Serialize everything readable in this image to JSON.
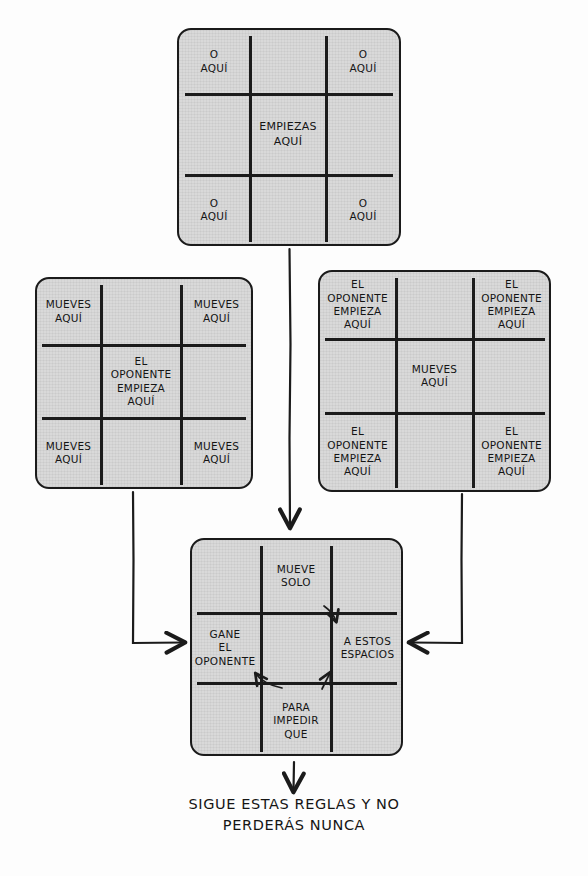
{
  "diagram": {
    "caption_lines": [
      "SIGUE ESTAS REGLAS Y NO",
      "PERDERÁS NUNCA"
    ],
    "colors": {
      "ink": "#1b1b1b",
      "board_fill": "#d9d9d9",
      "page": "#fdfdfd"
    },
    "grids": [
      {
        "id": "grid-empiezas",
        "name": "board-start",
        "cells": [
          {
            "pos": "top-left",
            "lines": [
              "O",
              "AQUÍ"
            ]
          },
          {
            "pos": "top-center",
            "lines": []
          },
          {
            "pos": "top-right",
            "lines": [
              "O",
              "AQUÍ"
            ]
          },
          {
            "pos": "middle-left",
            "lines": []
          },
          {
            "pos": "middle-center",
            "lines": [
              "EMPIEZAS",
              "AQUÍ"
            ]
          },
          {
            "pos": "middle-right",
            "lines": []
          },
          {
            "pos": "bottom-left",
            "lines": [
              "O",
              "AQUÍ"
            ]
          },
          {
            "pos": "bottom-center",
            "lines": []
          },
          {
            "pos": "bottom-right",
            "lines": [
              "O",
              "AQUÍ"
            ]
          }
        ]
      },
      {
        "id": "grid-oponente-centro",
        "name": "board-opponent-center",
        "cells": [
          {
            "pos": "top-left",
            "lines": [
              "MUEVES",
              "AQUÍ"
            ]
          },
          {
            "pos": "top-center",
            "lines": []
          },
          {
            "pos": "top-right",
            "lines": [
              "MUEVES",
              "AQUÍ"
            ]
          },
          {
            "pos": "middle-left",
            "lines": []
          },
          {
            "pos": "middle-center",
            "lines": [
              "EL",
              "OPONENTE",
              "EMPIEZA",
              "AQUÍ"
            ]
          },
          {
            "pos": "middle-right",
            "lines": []
          },
          {
            "pos": "bottom-left",
            "lines": [
              "MUEVES",
              "AQUÍ"
            ]
          },
          {
            "pos": "bottom-center",
            "lines": []
          },
          {
            "pos": "bottom-right",
            "lines": [
              "MUEVES",
              "AQUÍ"
            ]
          }
        ]
      },
      {
        "id": "grid-oponente-esquinas",
        "name": "board-opponent-corners",
        "cells": [
          {
            "pos": "top-left",
            "lines": [
              "EL",
              "OPONENTE",
              "EMPIEZA",
              "AQUÍ"
            ]
          },
          {
            "pos": "top-center",
            "lines": []
          },
          {
            "pos": "top-right",
            "lines": [
              "EL",
              "OPONENTE",
              "EMPIEZA",
              "AQUÍ"
            ]
          },
          {
            "pos": "middle-left",
            "lines": []
          },
          {
            "pos": "middle-center",
            "lines": [
              "MUEVES",
              "AQUÍ"
            ]
          },
          {
            "pos": "middle-right",
            "lines": []
          },
          {
            "pos": "bottom-left",
            "lines": [
              "EL",
              "OPONENTE",
              "EMPIEZA",
              "AQUÍ"
            ]
          },
          {
            "pos": "bottom-center",
            "lines": []
          },
          {
            "pos": "bottom-right",
            "lines": [
              "EL",
              "OPONENTE",
              "EMPIEZA",
              "AQUÍ"
            ]
          }
        ]
      },
      {
        "id": "grid-bloqueo",
        "name": "board-block",
        "cells": [
          {
            "pos": "top-left",
            "lines": []
          },
          {
            "pos": "top-center",
            "lines": [
              "MUEVE",
              "SOLO"
            ]
          },
          {
            "pos": "top-right",
            "lines": []
          },
          {
            "pos": "middle-left",
            "lines": [
              "GANE",
              "EL",
              "OPONENTE"
            ]
          },
          {
            "pos": "middle-center",
            "lines": []
          },
          {
            "pos": "middle-right",
            "lines": [
              "A ESTOS",
              "ESPACIOS"
            ]
          },
          {
            "pos": "bottom-left",
            "lines": []
          },
          {
            "pos": "bottom-center",
            "lines": [
              "PARA",
              "IMPEDIR",
              "QUE"
            ]
          },
          {
            "pos": "bottom-right",
            "lines": []
          }
        ]
      }
    ],
    "connectors": [
      {
        "name": "start-to-block",
        "from": "grid-empiezas",
        "to": "grid-bloqueo",
        "arrow": "down"
      },
      {
        "name": "opponent-center-to-block",
        "from": "grid-oponente-centro",
        "to": "grid-bloqueo",
        "arrow": "right"
      },
      {
        "name": "opponent-corners-to-block",
        "from": "grid-oponente-esquinas",
        "to": "grid-bloqueo",
        "arrow": "left"
      },
      {
        "name": "block-to-caption",
        "from": "grid-bloqueo",
        "to": "caption",
        "arrow": "down"
      }
    ]
  }
}
